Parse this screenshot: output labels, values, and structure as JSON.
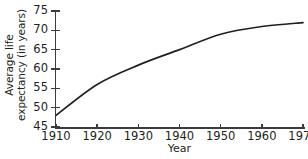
{
  "chart_data": {
    "type": "line",
    "title": "",
    "subtitle": "",
    "xlabel": "Year",
    "ylabel": "Average life expectancy (in years)",
    "ylabel_lines": [
      "Average life",
      "expectancy (in years)"
    ],
    "x": [
      1910,
      1920,
      1930,
      1940,
      1950,
      1960,
      1970
    ],
    "values": [
      48,
      56,
      61,
      65,
      69,
      71,
      72
    ],
    "series": [
      {
        "name": "Average life expectancy",
        "values": [
          48,
          56,
          61,
          65,
          69,
          71,
          72
        ],
        "color": "#231f20"
      }
    ],
    "xticks": [
      1910,
      1920,
      1930,
      1940,
      1950,
      1960,
      1970
    ],
    "xtick_labels": [
      "1910",
      "1920",
      "1930",
      "1940",
      "1950",
      "1960",
      "1970"
    ],
    "yticks": [
      45,
      50,
      55,
      60,
      65,
      70,
      75
    ],
    "ytick_labels": [
      "45",
      "50",
      "55",
      "60",
      "65",
      "70",
      "75"
    ],
    "xlim": [
      1910,
      1970
    ],
    "ylim": [
      45,
      75
    ],
    "grid": false,
    "legend": false,
    "legend_position": "none",
    "annotations": [],
    "axis_color": "#3b3b3b",
    "line_color": "#231f20",
    "background_color": "#ffffff"
  }
}
